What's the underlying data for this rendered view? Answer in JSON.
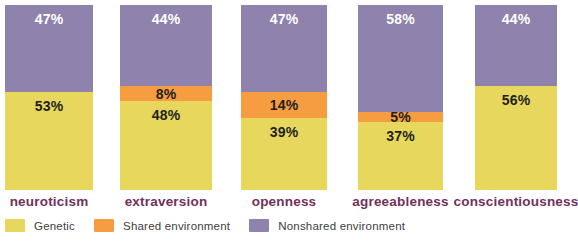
{
  "chart_data": {
    "type": "bar",
    "variant": "stacked-percentage-columns",
    "categories": [
      "neuroticism",
      "extraversion",
      "openness",
      "agreeableness",
      "conscientiousness"
    ],
    "series": [
      {
        "name": "Genetic",
        "color": "#e7d75d",
        "label_color": "#231f20",
        "values": [
          53,
          48,
          39,
          37,
          56
        ]
      },
      {
        "name": "Shared environment",
        "color": "#f69d41",
        "label_color": "#231f20",
        "values": [
          0,
          8,
          14,
          5,
          0
        ]
      },
      {
        "name": "Nonshared environment",
        "color": "#8f82ad",
        "label_color": "#ffffff",
        "values": [
          47,
          44,
          47,
          58,
          44
        ]
      }
    ],
    "stack_order_top_to_bottom": [
      "Nonshared environment",
      "Shared environment",
      "Genetic"
    ],
    "value_label_format": "{value}%",
    "title": "",
    "xlabel": "",
    "ylabel": "",
    "ylim": [
      0,
      100
    ],
    "grid": false,
    "legend_position": "bottom-left",
    "category_label_color": "#73305a"
  },
  "legend": {
    "items": [
      {
        "label": "Genetic",
        "color": "#e7d75d"
      },
      {
        "label": "Shared environment",
        "color": "#f69d41"
      },
      {
        "label": "Nonshared environment",
        "color": "#8f82ad"
      }
    ]
  }
}
